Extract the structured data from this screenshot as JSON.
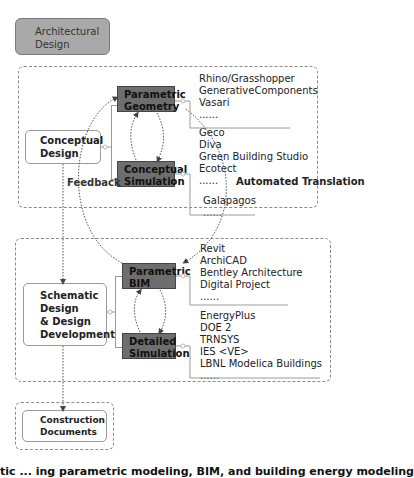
{
  "top_box": {
    "label_line1": "Architectural",
    "label_line2": "Design"
  },
  "conceptual_group": {
    "stage": {
      "line1": "Conceptual",
      "line2": "Design"
    },
    "parametric": {
      "line1": "Parametric",
      "line2": "Geometry"
    },
    "simulation": {
      "line1": "Conceptual",
      "line2": "Simulation"
    },
    "geometry_tools": [
      "Rhino/Grasshopper",
      "GenerativeComponents",
      "Vasari",
      "......"
    ],
    "simulation_tools": [
      "Geco",
      "Diva",
      "Green Building Studio",
      "Ecotect",
      "......"
    ],
    "optimization_tools": [
      "Galapagos",
      "......"
    ]
  },
  "schematic_group": {
    "stage": {
      "line1": "Schematic",
      "line2": "Design",
      "line3": "& Design",
      "line4": "Development"
    },
    "parametric": {
      "line1": "Parametric",
      "line2": "BIM"
    },
    "simulation": {
      "line1": "Detailed",
      "line2": "Simulation"
    },
    "bim_tools": [
      "Revit",
      "ArchiCAD",
      "Bentley Architecture",
      "Digital Project",
      "......"
    ],
    "simulation_tools": [
      "EnergyPlus",
      "DOE 2",
      "TRNSYS",
      "IES <VE>",
      "LBNL Modelica Buildings",
      "......"
    ]
  },
  "construction": {
    "line1": "Construction",
    "line2": "Documents"
  },
  "labels": {
    "feedback": "Feedback",
    "automated_translation": "Automated Translation"
  },
  "caption": "tic ... ing parametric modeling, BIM, and building energy modeling",
  "colors": {
    "dark_box": "#6e6e6e",
    "top_box": "#a9a9a9",
    "dashed": "#8a8a8a"
  }
}
